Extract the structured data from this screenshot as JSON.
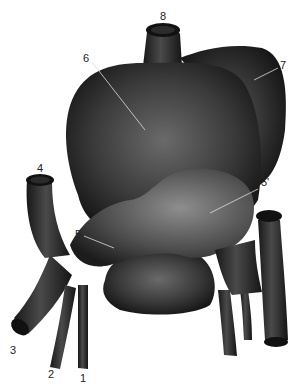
{
  "figure": {
    "colors": {
      "fill_dark": "#1e1e1e",
      "fill_mid": "#3a3a3a",
      "fill_light": "#8a8a8a",
      "leader": "#dddddd",
      "label": "#222222"
    }
  },
  "labels": [
    {
      "id": "1",
      "text": "1",
      "x": 80,
      "y": 373
    },
    {
      "id": "2",
      "text": "2",
      "x": 48,
      "y": 369
    },
    {
      "id": "3",
      "text": "3",
      "x": 10,
      "y": 345
    },
    {
      "id": "4",
      "text": "4",
      "x": 37,
      "y": 163
    },
    {
      "id": "5",
      "text": "5",
      "x": 75,
      "y": 234
    },
    {
      "id": "5prime",
      "text": "5'",
      "x": 261,
      "y": 180
    },
    {
      "id": "6",
      "text": "6",
      "x": 83,
      "y": 54
    },
    {
      "id": "7",
      "text": "7",
      "x": 280,
      "y": 63
    },
    {
      "id": "8",
      "text": "8",
      "x": 162,
      "y": 12
    }
  ]
}
